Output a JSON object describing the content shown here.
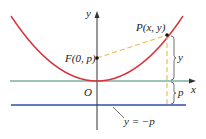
{
  "diagram": {
    "colors": {
      "parabola": "#d8323c",
      "x_axis": "#3a8a6e",
      "directrix": "#2f4fa8",
      "dashed": "#f0b84a",
      "axis": "#333333",
      "text": "#1a1a1a"
    },
    "labels": {
      "y_axis": "y",
      "x_axis": "x",
      "origin": "O",
      "focus": "F(0, p)",
      "point": "P(x, y)",
      "brace_y": "y",
      "brace_p": "p",
      "directrix": "y = −p"
    }
  }
}
